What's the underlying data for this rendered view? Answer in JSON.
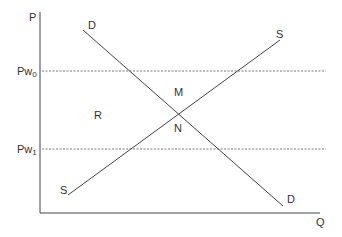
{
  "diagram": {
    "type": "supply-demand",
    "axes": {
      "y_label": "P",
      "x_label": "Q"
    },
    "price_lines": [
      {
        "label": "Pw",
        "subscript": "0",
        "style": "dashed"
      },
      {
        "label": "Pw",
        "subscript": "1",
        "style": "dashed"
      }
    ],
    "curves": {
      "demand": {
        "label_start": "D",
        "label_end": "D"
      },
      "supply": {
        "label_start": "S",
        "label_end": "S"
      }
    },
    "regions": {
      "r": "R",
      "m": "M",
      "n": "N"
    },
    "colors": {
      "line": "#444444",
      "dashed": "#555555",
      "text": "#333333",
      "background": "#ffffff"
    }
  }
}
